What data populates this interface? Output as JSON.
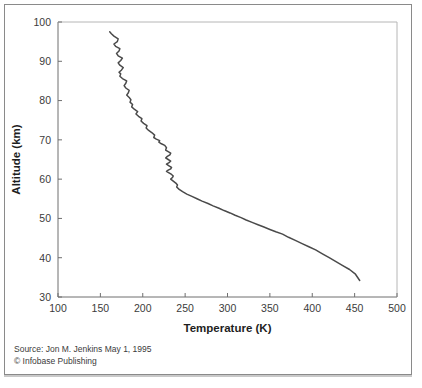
{
  "figure": {
    "background_color": "#ffffff",
    "frame_color": "#8a8a8a",
    "curve_color": "#4a4a4a"
  },
  "caption": {
    "source_line": "Source: Jon M. Jenkins May 1, 1995",
    "copyright_line": "© Infobase Publishing"
  },
  "chart_data": {
    "type": "line",
    "title": "",
    "xlabel": "Temperature (K)",
    "ylabel": "Altitude (km)",
    "xlim": [
      100,
      500
    ],
    "ylim": [
      30,
      100
    ],
    "xticks": [
      100,
      150,
      200,
      250,
      300,
      350,
      400,
      450,
      500
    ],
    "yticks": [
      30,
      40,
      50,
      60,
      70,
      80,
      90,
      100
    ],
    "xtick_labels": [
      "100",
      "150",
      "200",
      "250",
      "300",
      "350",
      "400",
      "450",
      "500"
    ],
    "ytick_labels": [
      "30",
      "40",
      "50",
      "60",
      "70",
      "80",
      "90",
      "100"
    ],
    "grid": false,
    "legend": false,
    "series": [
      {
        "name": "Venus atmospheric temperature profile",
        "x_label": "Temperature (K)",
        "y_label": "Altitude (km)",
        "x": [
          161,
          163,
          166,
          171,
          170,
          166,
          168,
          173,
          172,
          169,
          171,
          176,
          174,
          171,
          173,
          177,
          175,
          172,
          174,
          173,
          176,
          181,
          180,
          178,
          180,
          184,
          183,
          181,
          184,
          186,
          185,
          188,
          187,
          190,
          194,
          192,
          195,
          199,
          198,
          201,
          205,
          204,
          207,
          211,
          214,
          213,
          216,
          220,
          219,
          222,
          226,
          228,
          227,
          230,
          233,
          232,
          229,
          227,
          230,
          233,
          231,
          228,
          231,
          234,
          233,
          230,
          228,
          231,
          234,
          236,
          235,
          233,
          236,
          239,
          241,
          240,
          243,
          247,
          252,
          258,
          264,
          270,
          277,
          283,
          290,
          296,
          303,
          309,
          316,
          322,
          329,
          336,
          343,
          350,
          357,
          365,
          372,
          380,
          388,
          396,
          404,
          412,
          420,
          428,
          436,
          444,
          451,
          456
        ],
        "y": [
          97.5,
          97.0,
          96.4,
          95.7,
          95.0,
          94.4,
          93.8,
          93.2,
          92.6,
          92.0,
          91.4,
          90.8,
          90.2,
          89.6,
          89.0,
          88.4,
          87.8,
          87.2,
          86.8,
          86.2,
          85.6,
          85.0,
          84.4,
          83.8,
          83.2,
          82.6,
          82.0,
          81.4,
          80.8,
          80.2,
          79.6,
          79.0,
          78.4,
          77.8,
          77.2,
          76.6,
          76.0,
          75.4,
          74.8,
          74.2,
          73.6,
          73.0,
          72.4,
          71.8,
          71.2,
          70.6,
          70.2,
          69.8,
          69.4,
          69.0,
          68.6,
          68.0,
          67.4,
          67.0,
          66.6,
          66.2,
          65.8,
          65.4,
          65.0,
          64.6,
          64.2,
          63.8,
          63.4,
          63.0,
          62.6,
          62.3,
          62.0,
          61.6,
          61.2,
          60.8,
          60.4,
          60.0,
          59.5,
          59.0,
          58.5,
          58.0,
          57.4,
          56.8,
          56.2,
          55.6,
          55.0,
          54.4,
          53.8,
          53.2,
          52.6,
          52.0,
          51.4,
          50.8,
          50.2,
          49.6,
          49.0,
          48.4,
          47.8,
          47.2,
          46.6,
          46.0,
          45.2,
          44.4,
          43.6,
          42.8,
          42.0,
          41.0,
          40.0,
          39.0,
          38.0,
          37.0,
          35.8,
          34.2
        ]
      }
    ]
  }
}
